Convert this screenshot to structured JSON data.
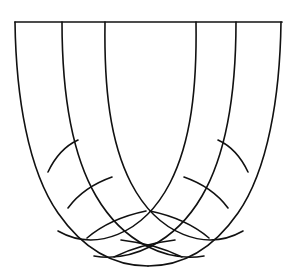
{
  "figure": {
    "canvas": {
      "width": 296,
      "height": 275
    },
    "style": {
      "background_color": "#ffffff",
      "line_color": "#111111",
      "line_width": 1.6
    },
    "springing_line": {
      "label": "springing line",
      "y": 22,
      "x_start": 15,
      "x_end": 282,
      "path": "M 15 22 L 282 22"
    },
    "rib_anchors_x": [
      15,
      62,
      105,
      196,
      236,
      281
    ],
    "ribs": [
      {
        "name": "rib-outer-left",
        "anchor_x": 15,
        "path": "M 15 22 C 16 96 28 170 58 213 C 88 256 122 266 148 266"
      },
      {
        "name": "rib-mid-left",
        "anchor_x": 62,
        "path": "M 62 22 C 62 92 71 153 96 196 C 124 244 168 262 204 256"
      },
      {
        "name": "rib-inner-left",
        "anchor_x": 105,
        "path": "M 105 22 C 104 88 110 142 131 183 C 158 235 206 252 243 231"
      },
      {
        "name": "rib-inner-right",
        "anchor_x": 196,
        "path": "M 196 22 C 197 88 191 142 170 183 C 143 235 95 252 58 231"
      },
      {
        "name": "rib-mid-right",
        "anchor_x": 236,
        "path": "M 236 22 C 236 92 227 153 202 196 C 174 244 130 262 94 256"
      },
      {
        "name": "rib-outer-right",
        "anchor_x": 281,
        "path": "M 281 22 C 280 96 268 170 238 213 C 208 256 174 266 148 266"
      }
    ],
    "transverse_arcs": [
      {
        "name": "transverse-arc-left-1",
        "side": "left",
        "ring": 1,
        "path": "M 78 140 C 67 145 56 155 48 172"
      },
      {
        "name": "transverse-arc-left-2",
        "side": "left",
        "ring": 2,
        "path": "M 112 177 C 95 183 79 193 68 208"
      },
      {
        "name": "transverse-arc-left-3",
        "side": "left",
        "ring": 3,
        "path": "M 146 211 C 122 216 101 226 87 238"
      },
      {
        "name": "transverse-arc-left-4",
        "side": "left",
        "ring": 4,
        "path": "M 175 240 C 150 243 128 250 114 257"
      },
      {
        "name": "transverse-arc-right-1",
        "side": "right",
        "ring": 1,
        "path": "M 218 140 C 229 145 240 155 248 172"
      },
      {
        "name": "transverse-arc-right-2",
        "side": "right",
        "ring": 2,
        "path": "M 184 177 C 201 183 217 193 228 208"
      },
      {
        "name": "transverse-arc-right-3",
        "side": "right",
        "ring": 3,
        "path": "M 150 211 C 174 216 195 226 209 238"
      },
      {
        "name": "transverse-arc-right-4",
        "side": "right",
        "ring": 4,
        "path": "M 121 240 C 146 243 168 250 182 257"
      }
    ]
  }
}
